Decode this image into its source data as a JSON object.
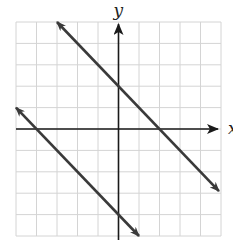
{
  "chart_data": {
    "type": "line",
    "title": "",
    "xlabel": "x",
    "ylabel": "y",
    "xlim": [
      -5,
      5
    ],
    "ylim": [
      -5,
      5
    ],
    "grid": true,
    "grid_step": 1,
    "tick_labels": false,
    "series": [
      {
        "name": "upper line",
        "equation": "y = -x + 2",
        "slope": -1,
        "y_intercept": 2,
        "x_intercept": 2,
        "points": [
          [
            -3,
            5
          ],
          [
            0,
            2
          ],
          [
            2,
            0
          ],
          [
            4.9,
            -2.9
          ]
        ],
        "arrows": "both"
      },
      {
        "name": "lower line",
        "equation": "y = -x - 4",
        "slope": -1,
        "y_intercept": -4,
        "x_intercept": -4,
        "points": [
          [
            -5,
            1
          ],
          [
            -4,
            0
          ],
          [
            0,
            -4
          ],
          [
            1,
            -5
          ]
        ],
        "arrows": "both"
      }
    ]
  },
  "colors": {
    "grid": "#d4d4d4",
    "axis": "#1a1a1a",
    "line": "#3a3a3a",
    "background": "#ffffff"
  },
  "labels": {
    "x_axis": "x",
    "y_axis": "y"
  }
}
